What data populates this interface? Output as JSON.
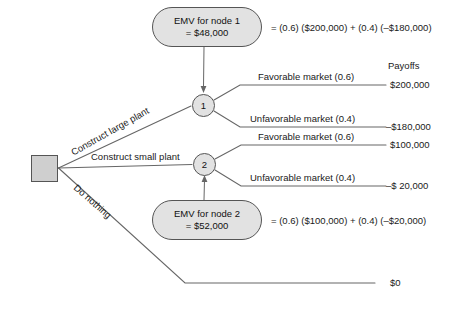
{
  "diagram": {
    "payoffs_header": "Payoffs",
    "decision_node": {
      "name": "decision-square"
    },
    "chance_nodes": [
      {
        "label": "1"
      },
      {
        "label": "2"
      }
    ],
    "emv_boxes": [
      {
        "line1": "EMV for node 1",
        "line2": "= $48,000",
        "equation": "= (0.6) ($200,000) + (0.4) (–$180,000)"
      },
      {
        "line1": "EMV for node 2",
        "line2": "= $52,000",
        "equation": "= (0.6) ($100,000) + (0.4) (–$20,000)"
      }
    ],
    "decision_branches": [
      {
        "label": "Construct large plant"
      },
      {
        "label": "Construct small plant"
      },
      {
        "label": "Do nothing"
      }
    ],
    "outcome_branches": [
      {
        "label": "Favorable market (0.6)",
        "payoff": "$200,000"
      },
      {
        "label": "Unfavorable market (0.4)",
        "payoff": "–$180,000"
      },
      {
        "label": "Favorable market (0.6)",
        "payoff": "$100,000"
      },
      {
        "label": "Unfavorable market (0.4)",
        "payoff": "–$ 20,000"
      }
    ],
    "do_nothing_payoff": "$0",
    "colors": {
      "line": "#666666",
      "node_fill": "#e2e2e2",
      "square_fill": "#cfcfcf",
      "text": "#1a1a1a",
      "background": "#ffffff"
    }
  }
}
